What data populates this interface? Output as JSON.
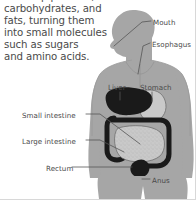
{
  "document": {
    "type": "anatomy-diagram",
    "subject": "human digestive system"
  },
  "intro": {
    "text": "make up proteins,\ncarbohydrates, and\nfats, turning them\ninto small molecules\nsuch as sugars\nand amino acids."
  },
  "labels": {
    "mouth": "Mouth",
    "esophagus": "Esophagus",
    "liver": "Liver",
    "stomach": "Stomach",
    "small_intestine": "Small intestine",
    "large_intestine": "Large intestine",
    "rectum": "Rectum",
    "anus": "Anus"
  },
  "colors": {
    "background": "#ffffff",
    "text": "#4a4a4a",
    "body_silhouette": "#a6a6a6",
    "body_outline": "#8f8f8f",
    "organ_dark": "#1a1a1a",
    "organ_light": "#c9c9c9",
    "leader_line": "#555555",
    "border": "#d8d8d8"
  }
}
